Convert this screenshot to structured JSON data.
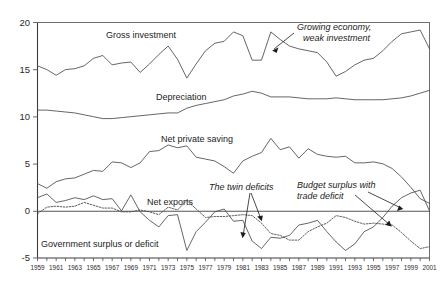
{
  "chart_data": {
    "type": "line",
    "title": "",
    "xlabel": "",
    "ylabel": "",
    "xlim": [
      1959,
      2001
    ],
    "ylim": [
      -5,
      20
    ],
    "grid": false,
    "legend": "inline-labels",
    "y_ticks": [
      "20",
      "15",
      "10",
      "5",
      "0",
      "-5"
    ],
    "y_tick_values": [
      20,
      15,
      10,
      5,
      0,
      -5
    ],
    "x_ticks": [
      "1959",
      "1961",
      "1963",
      "1965",
      "1967",
      "1969",
      "1971",
      "1973",
      "1975",
      "1977",
      "1979",
      "1981",
      "1983",
      "1985",
      "1987",
      "1989",
      "1991",
      "1993",
      "1995",
      "1997",
      "1999",
      "2001"
    ],
    "x_tick_values": [
      1959,
      1961,
      1963,
      1965,
      1967,
      1969,
      1971,
      1973,
      1975,
      1977,
      1979,
      1981,
      1983,
      1985,
      1987,
      1989,
      1991,
      1993,
      1995,
      1997,
      1999,
      2001
    ],
    "x": [
      1959,
      1960,
      1961,
      1962,
      1963,
      1964,
      1965,
      1966,
      1967,
      1968,
      1969,
      1970,
      1971,
      1972,
      1973,
      1974,
      1975,
      1976,
      1977,
      1978,
      1979,
      1980,
      1981,
      1982,
      1983,
      1984,
      1985,
      1986,
      1987,
      1988,
      1989,
      1990,
      1991,
      1992,
      1993,
      1994,
      1995,
      1996,
      1997,
      1998,
      1999,
      2000,
      2001
    ],
    "series": [
      {
        "name": "Gross investment",
        "style": "solid",
        "values": [
          15.4,
          15.0,
          14.4,
          15.0,
          15.1,
          15.4,
          16.2,
          16.5,
          15.5,
          15.7,
          15.8,
          14.7,
          15.6,
          16.6,
          17.5,
          16.1,
          14.1,
          15.6,
          17.0,
          17.8,
          18.0,
          19.0,
          18.6,
          16.0,
          16.0,
          19.0,
          18.2,
          17.5,
          17.2,
          17.0,
          16.8,
          15.8,
          14.3,
          14.8,
          15.5,
          16.0,
          16.2,
          17.0,
          18.0,
          18.8,
          19.0,
          19.2,
          17.2
        ],
        "ylabel_text": "Gross investment"
      },
      {
        "name": "Depreciation",
        "style": "solid",
        "values": [
          10.7,
          10.7,
          10.6,
          10.5,
          10.4,
          10.2,
          10.0,
          9.8,
          9.8,
          9.9,
          10.0,
          10.1,
          10.2,
          10.3,
          10.4,
          10.4,
          10.9,
          11.2,
          11.4,
          11.6,
          11.8,
          12.2,
          12.4,
          12.7,
          12.5,
          12.1,
          12.1,
          12.1,
          12.0,
          11.9,
          11.9,
          11.9,
          12.0,
          11.9,
          11.8,
          11.8,
          11.8,
          11.8,
          11.9,
          12.0,
          12.2,
          12.5,
          12.8
        ],
        "ylabel_text": "Depreciation"
      },
      {
        "name": "Net private saving",
        "style": "solid",
        "values": [
          2.9,
          2.4,
          3.1,
          3.4,
          3.5,
          3.9,
          4.3,
          4.2,
          5.2,
          5.1,
          4.6,
          5.1,
          6.3,
          6.4,
          7.0,
          6.7,
          6.9,
          5.7,
          5.5,
          5.3,
          4.7,
          4.0,
          5.3,
          5.8,
          6.2,
          7.7,
          6.5,
          6.8,
          5.6,
          6.6,
          6.0,
          5.8,
          5.7,
          5.8,
          5.1,
          5.1,
          5.2,
          5.0,
          4.5,
          3.6,
          2.5,
          1.3,
          0.8
        ],
        "ylabel_text": "Net private saving"
      },
      {
        "name": "Net exports",
        "style": "dotted",
        "values": [
          -0.3,
          0.4,
          0.5,
          0.4,
          0.5,
          0.9,
          0.6,
          0.3,
          0.3,
          -0.1,
          -0.1,
          0.1,
          -0.1,
          -0.4,
          0.4,
          0.1,
          1.1,
          0.2,
          -0.7,
          -0.6,
          -0.6,
          -0.5,
          -0.4,
          -0.5,
          -1.3,
          -2.4,
          -2.6,
          -3.1,
          -3.1,
          -2.2,
          -1.7,
          -1.3,
          -0.5,
          -0.7,
          -1.1,
          -1.4,
          -1.3,
          -1.4,
          -1.5,
          -2.3,
          -3.2,
          -4.0,
          -3.8
        ],
        "ylabel_text": "Net exports"
      },
      {
        "name": "Government surplus or deficit",
        "style": "solid",
        "values": [
          1.4,
          1.8,
          0.9,
          1.1,
          1.4,
          1.2,
          1.6,
          1.2,
          1.3,
          0.0,
          1.7,
          -0.1,
          -1.0,
          -1.7,
          -0.5,
          -0.4,
          -4.2,
          -2.2,
          -1.2,
          -0.1,
          0.2,
          -1.1,
          -1.0,
          -3.2,
          -4.0,
          -2.8,
          -2.9,
          -2.6,
          -1.5,
          -1.3,
          -1.0,
          -2.2,
          -3.3,
          -4.2,
          -3.5,
          -2.2,
          -1.7,
          -0.7,
          0.5,
          1.4,
          1.9,
          2.2,
          0.0
        ],
        "ylabel_text": "Government surplus or deficit"
      }
    ],
    "annotations": [
      {
        "id": "growing-economy-weak-investment",
        "text_line1": "Growing economy,",
        "text_line2": "weak investment",
        "style": "italic",
        "points_to_series": "Gross investment",
        "points_to_year": 1987
      },
      {
        "id": "the-twin-deficits",
        "text_line1": "The twin deficits",
        "text_line2": "",
        "style": "italic",
        "points_to_series": "Government surplus or deficit, Net exports",
        "points_to_year": 1984
      },
      {
        "id": "budget-surplus-with-trade-deficit",
        "text_line1": "Budget surplus with",
        "text_line2": "trade deficit",
        "style": "italic",
        "points_to_series": "Government surplus or deficit, Net exports",
        "points_to_year": 1999
      }
    ]
  },
  "colors": {
    "background": "#ffffff",
    "line": "#4a4a4a",
    "axis": "#3c3c3c",
    "text": "#1c1c1c"
  }
}
